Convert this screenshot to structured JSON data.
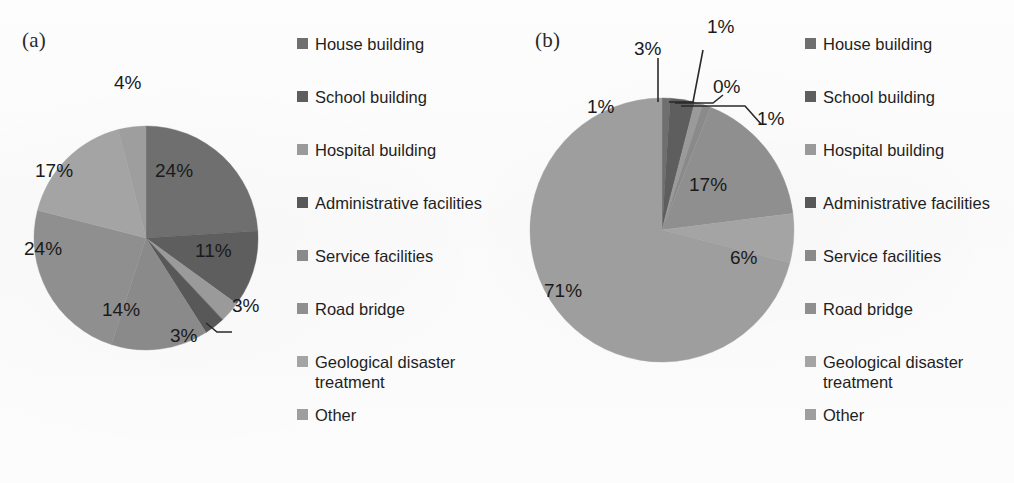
{
  "figure": {
    "background": "#fbfbfb",
    "text_color": "#1a1a1a"
  },
  "palette": {
    "house_building": "#6f6f6f",
    "school_building": "#5e5e5e",
    "hospital_building": "#9a9a9a",
    "administrative_facilities": "#585858",
    "service_facilities": "#8a8a8a",
    "road_bridge": "#8f8f8f",
    "geological_disaster_treatment": "#a4a4a4",
    "other": "#9e9e9e"
  },
  "legend": {
    "items": [
      {
        "label": "House building",
        "color": "#6f6f6f"
      },
      {
        "label": "School building",
        "color": "#5e5e5e"
      },
      {
        "label": "Hospital building",
        "color": "#9a9a9a"
      },
      {
        "label": "Administrative facilities",
        "color": "#585858"
      },
      {
        "label": "Service facilities",
        "color": "#8a8a8a"
      },
      {
        "label": "Road bridge",
        "color": "#8f8f8f"
      },
      {
        "label": "Geological disaster treatment",
        "color": "#a4a4a4"
      },
      {
        "label": "Other",
        "color": "#9e9e9e"
      }
    ]
  },
  "panels": [
    {
      "id": "a",
      "tag": "(a)"
    },
    {
      "id": "b",
      "tag": "(b)"
    }
  ],
  "chart_data": [
    {
      "type": "pie",
      "title": "(a)",
      "categories": [
        "House building",
        "School building",
        "Hospital building",
        "Administrative facilities",
        "Service facilities",
        "Road bridge",
        "Geological disaster treatment",
        "Other"
      ],
      "values": [
        24,
        11,
        3,
        3,
        14,
        24,
        17,
        4
      ],
      "labels": [
        "24%",
        "11%",
        "3%",
        "3%",
        "14%",
        "24%",
        "17%",
        "4%"
      ],
      "colors": [
        "#6f6f6f",
        "#5e5e5e",
        "#9a9a9a",
        "#585858",
        "#8a8a8a",
        "#8f8f8f",
        "#a4a4a4",
        "#9e9e9e"
      ],
      "unit": "%",
      "start_angle": 0,
      "direction": "clockwise",
      "legend_position": "right",
      "grid": false
    },
    {
      "type": "pie",
      "title": "(b)",
      "categories": [
        "House building",
        "School building",
        "Hospital building",
        "Administrative facilities",
        "Service facilities",
        "Road bridge",
        "Geological disaster treatment",
        "Other"
      ],
      "values": [
        1,
        3,
        1,
        0,
        1,
        17,
        6,
        71
      ],
      "labels": [
        "1%",
        "3%",
        "1%",
        "0%",
        "1%",
        "17%",
        "6%",
        "71%"
      ],
      "colors": [
        "#6f6f6f",
        "#5e5e5e",
        "#9a9a9a",
        "#585858",
        "#8a8a8a",
        "#8f8f8f",
        "#a4a4a4",
        "#9e9e9e"
      ],
      "unit": "%",
      "start_angle": 0,
      "direction": "clockwise",
      "legend_position": "right",
      "grid": false
    }
  ],
  "pie_a_labels": {
    "p24a": "24%",
    "p11": "11%",
    "p3a": "3%",
    "p3b": "3%",
    "p14": "14%",
    "p24b": "24%",
    "p17": "17%",
    "p4": "4%"
  },
  "pie_b_labels": {
    "p1a": "1%",
    "p3": "3%",
    "p1b": "1%",
    "p0": "0%",
    "p1c": "1%",
    "p17": "17%",
    "p6": "6%",
    "p71": "71%"
  }
}
